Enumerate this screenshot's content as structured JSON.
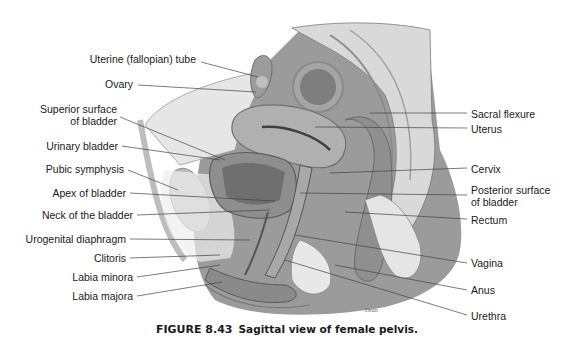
{
  "figure": {
    "number": "FIGURE 8.43",
    "caption": "Sagittal view of female pelvis."
  },
  "labels_left": [
    {
      "text": "Uterine (fallopian) tube",
      "x": 199,
      "y": 59
    },
    {
      "text": "Ovary",
      "x": 130,
      "y": 84
    },
    {
      "text": "Superior surface",
      "x": 116,
      "y": 110
    },
    {
      "text": "of bladder",
      "x": 116,
      "y": 122
    },
    {
      "text": "Urinary bladder",
      "x": 118,
      "y": 146
    },
    {
      "text": "Pubic symphysis",
      "x": 124,
      "y": 169
    },
    {
      "text": "Apex of bladder",
      "x": 126,
      "y": 193
    },
    {
      "text": "Neck of the bladder",
      "x": 133,
      "y": 215
    },
    {
      "text": "Urogenital diaphragm",
      "x": 126,
      "y": 239
    },
    {
      "text": "Clitoris",
      "x": 126,
      "y": 258
    },
    {
      "text": "Labia minora",
      "x": 133,
      "y": 277
    },
    {
      "text": "Labia majora",
      "x": 133,
      "y": 296
    }
  ],
  "labels_right": [
    {
      "text": "Sacral flexure",
      "x": 471,
      "y": 114
    },
    {
      "text": "Uterus",
      "x": 471,
      "y": 129
    },
    {
      "text": "Cervix",
      "x": 471,
      "y": 169
    },
    {
      "text": "Posterior surface",
      "x": 471,
      "y": 190
    },
    {
      "text": "of bladder",
      "x": 471,
      "y": 202
    },
    {
      "text": "Rectum",
      "x": 471,
      "y": 220
    },
    {
      "text": "Vagina",
      "x": 471,
      "y": 263
    },
    {
      "text": "Anus",
      "x": 471,
      "y": 290
    },
    {
      "text": "Urethra",
      "x": 471,
      "y": 316
    }
  ]
}
